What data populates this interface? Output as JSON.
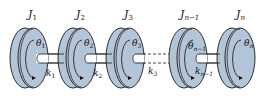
{
  "diagram": {
    "colors": {
      "disk_fill": "#b3c5d8",
      "disk_stroke": "#1a1a1a",
      "shaft_fill": "#ffffff",
      "background": "#ffffff"
    },
    "disks": [
      {
        "inertia_label": "J1",
        "inertia_sub": "1",
        "angle_label": "θ",
        "angle_sub": "1"
      },
      {
        "inertia_label": "J2",
        "inertia_sub": "2",
        "angle_label": "θ",
        "angle_sub": "2"
      },
      {
        "inertia_label": "J3",
        "inertia_sub": "3",
        "angle_label": "θ",
        "angle_sub": "3"
      },
      {
        "inertia_label": "Jn−1",
        "inertia_sub": "n−1",
        "angle_label": "θ",
        "angle_sub": "n−1"
      },
      {
        "inertia_label": "Jn",
        "inertia_sub": "n",
        "angle_label": "θ",
        "angle_sub": "n"
      }
    ],
    "shafts": [
      {
        "stiffness_sub": "1"
      },
      {
        "stiffness_sub": "2"
      },
      {
        "stiffness_sub": "3"
      },
      {
        "stiffness_sub": "n−1"
      }
    ],
    "symbols": {
      "J": "J",
      "k": "k",
      "theta": "θ"
    }
  }
}
